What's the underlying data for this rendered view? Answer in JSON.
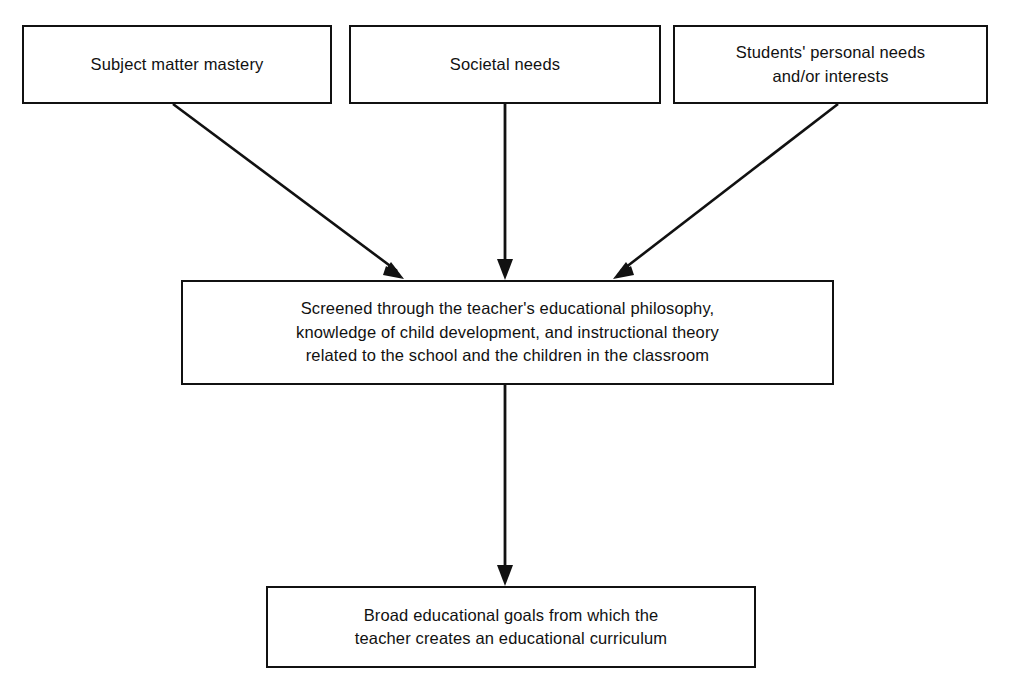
{
  "diagram": {
    "background_color": "#ffffff",
    "line_color": "#111111",
    "text_color": "#111111",
    "nodes": [
      {
        "id": "subject-matter-mastery",
        "label": "Subject matter mastery"
      },
      {
        "id": "societal-needs",
        "label": "Societal needs"
      },
      {
        "id": "students-personal-needs",
        "label": "Students' personal needs\nand/or interests"
      },
      {
        "id": "screened-philosophy",
        "label": "Screened through the teacher's educational philosophy,\nknowledge of child development, and instructional theory\nrelated to the school and the children in the classroom"
      },
      {
        "id": "broad-goals",
        "label": "Broad educational goals from which the\nteacher creates an educational curriculum"
      }
    ],
    "connectors": [
      {
        "id": "subject-matter-to-screen",
        "from": "subject-matter-mastery",
        "to": "screened-philosophy",
        "style": "arrow-diagonal-right-down"
      },
      {
        "id": "societal-needs-to-screen",
        "from": "societal-needs",
        "to": "screened-philosophy",
        "style": "arrow-vertical-down"
      },
      {
        "id": "students-needs-to-screen",
        "from": "students-personal-needs",
        "to": "screened-philosophy",
        "style": "arrow-diagonal-left-down"
      },
      {
        "id": "screen-to-broad-goals",
        "from": "screened-philosophy",
        "to": "broad-goals",
        "style": "arrow-vertical-down"
      }
    ]
  }
}
